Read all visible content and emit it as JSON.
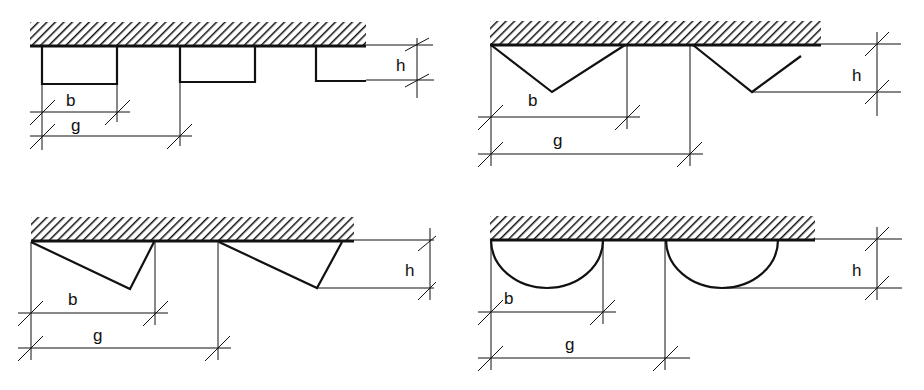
{
  "figure": {
    "colors": {
      "ink": "#111111",
      "background": "#ffffff"
    },
    "panels": [
      {
        "id": "rectangular",
        "shape": "rectangular ribs",
        "labels": {
          "b": "b",
          "g": "g",
          "h": "h"
        }
      },
      {
        "id": "triangular-symmetric",
        "shape": "symmetric V / triangular ribs",
        "labels": {
          "b": "b",
          "g": "g",
          "h": "h"
        }
      },
      {
        "id": "triangular-asymmetric",
        "shape": "asymmetric sawtooth ribs",
        "labels": {
          "b": "b",
          "g": "g",
          "h": "h"
        }
      },
      {
        "id": "semicircular",
        "shape": "semicircular ribs",
        "labels": {
          "b": "b",
          "g": "g",
          "h": "h"
        }
      }
    ]
  }
}
